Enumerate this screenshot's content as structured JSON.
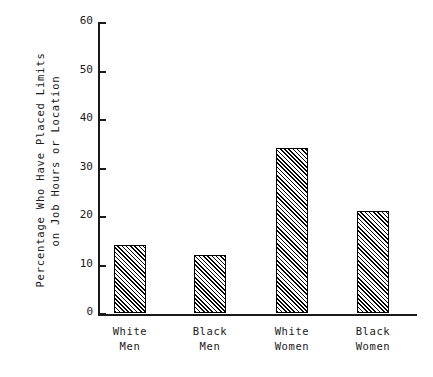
{
  "chart_data": {
    "type": "bar",
    "title": "",
    "subtitle": "",
    "xlabel": "",
    "ylabel_lines": [
      "Percentage Who Have Placed Limits",
      "on Job Hours or Location"
    ],
    "categories": [
      [
        "White",
        "Men"
      ],
      [
        "Black",
        "Men"
      ],
      [
        "White",
        "Women"
      ],
      [
        "Black",
        "Women"
      ]
    ],
    "category_labels": [
      "White Men",
      "Black Men",
      "White Women",
      "Black Women"
    ],
    "values": [
      14,
      12,
      34,
      21
    ],
    "ylim": [
      0,
      60
    ],
    "yticks": [
      0,
      10,
      20,
      30,
      40,
      50,
      60
    ],
    "ytick_labels": [
      "0",
      "10",
      "20",
      "30",
      "40",
      "50",
      "60"
    ],
    "grid": false,
    "legend": false,
    "bar_fill": "diagonal-hatch",
    "bar_edge_color": "#000000",
    "bar_face_color": "#ffffff",
    "background_color": "#ffffff"
  }
}
